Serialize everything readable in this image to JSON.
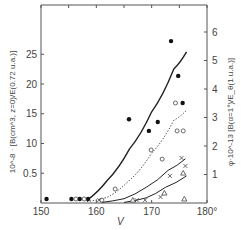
{
  "chart_data": {
    "type": "scatter",
    "title": "",
    "xlabel": "V",
    "ylabel_left": "10^-8 · [B(cm^3, z=0)/E(0.72 u.a.)]",
    "ylabel_right": "φ·10^-13 [B(α=1°)/E_θ(1 u.a.)]",
    "x_ticks": [
      "150",
      "160",
      "170",
      "180°"
    ],
    "x_tick_values": [
      150,
      160,
      170,
      180
    ],
    "y_left_ticks": [
      "0.5",
      "10",
      "15",
      "20",
      "25"
    ],
    "y_left_tick_values": [
      0.5,
      1.0,
      1.5,
      2.0,
      2.5
    ],
    "y_right_ticks": [
      "1",
      "2",
      "3",
      "4",
      "5",
      "6"
    ],
    "y_right_tick_values": [
      1,
      2,
      3,
      4,
      5,
      6
    ],
    "xlim": [
      150,
      180
    ],
    "ylim_right": [
      0,
      6.5
    ],
    "grid": false,
    "legend": "none",
    "series": [
      {
        "name": "filled circles",
        "marker": "filled-circle",
        "points": [
          [
            151.0,
            0.07
          ],
          [
            155.5,
            0.07
          ],
          [
            157.0,
            0.07
          ],
          [
            158.5,
            0.07
          ],
          [
            165.9,
            2.87
          ],
          [
            169.5,
            2.46
          ],
          [
            171.1,
            2.77
          ],
          [
            173.5,
            5.61
          ],
          [
            174.8,
            4.39
          ],
          [
            175.6,
            3.44
          ]
        ]
      },
      {
        "name": "open circles",
        "marker": "open-circle",
        "points": [
          [
            156.3,
            0.07
          ],
          [
            157.8,
            0.07
          ],
          [
            161.0,
            0.03
          ],
          [
            163.4,
            0.42
          ],
          [
            169.9,
            1.79
          ],
          [
            171.9,
            1.47
          ],
          [
            174.6,
            2.46
          ],
          [
            175.7,
            2.46
          ],
          [
            174.3,
            3.44
          ]
        ]
      },
      {
        "name": "crosses",
        "marker": "cross",
        "points": [
          [
            160.5,
            0.03
          ],
          [
            167.3,
            0.03
          ],
          [
            168.8,
            0.03
          ],
          [
            171.6,
            0.14
          ],
          [
            173.3,
            0.88
          ],
          [
            175.4,
            1.51
          ],
          [
            176.1,
            1.23
          ]
        ]
      },
      {
        "name": "triangles",
        "marker": "triangle",
        "points": [
          [
            166.6,
            0.03
          ],
          [
            172.3,
            0.28
          ],
          [
            175.7,
            0.98
          ],
          [
            175.9,
            0.07
          ]
        ]
      }
    ],
    "curves": [
      {
        "name": "solid curve",
        "style": "solid",
        "points": [
          [
            158.3,
            0.1
          ],
          [
            162,
            0.8
          ],
          [
            166,
            1.9
          ],
          [
            170,
            3.2
          ],
          [
            174,
            4.7
          ],
          [
            176.3,
            5.3
          ]
        ]
      },
      {
        "name": "dotted curve",
        "style": "dotted",
        "points": [
          [
            158.3,
            0.05
          ],
          [
            162,
            0.2
          ],
          [
            166,
            0.8
          ],
          [
            170,
            1.75
          ],
          [
            174,
            2.9
          ],
          [
            176.3,
            3.25
          ]
        ]
      },
      {
        "name": "dash curve (crosses)",
        "style": "solid-thin",
        "points": [
          [
            161,
            0.02
          ],
          [
            165,
            0.15
          ],
          [
            169,
            0.55
          ],
          [
            173,
            1.15
          ],
          [
            176.1,
            1.55
          ]
        ]
      },
      {
        "name": "dash curve (triangles)",
        "style": "solid-thin",
        "points": [
          [
            165,
            0.02
          ],
          [
            169,
            0.18
          ],
          [
            172.5,
            0.55
          ],
          [
            176.3,
            0.95
          ]
        ]
      }
    ]
  }
}
